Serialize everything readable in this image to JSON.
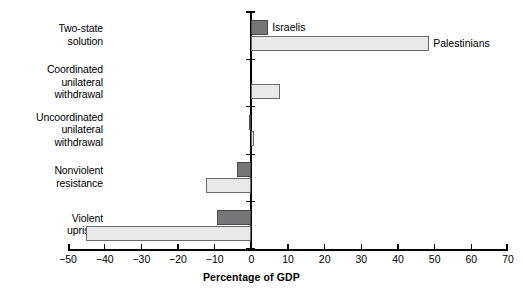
{
  "chart_data": {
    "type": "bar",
    "orientation": "horizontal",
    "title": "",
    "subtitle": "",
    "xlabel": "Percentage of GDP",
    "ylabel": "",
    "xlim": [
      -50,
      70
    ],
    "xticks": [
      -50,
      -40,
      -30,
      -20,
      -10,
      0,
      10,
      20,
      30,
      40,
      50,
      60,
      70
    ],
    "xticklabels": [
      "−50",
      "−40",
      "−30",
      "−20",
      "−10",
      "0",
      "10",
      "20",
      "30",
      "40",
      "50",
      "60",
      "70"
    ],
    "grid": false,
    "legend_position": "inline-callout",
    "categories": [
      "Two-state\nsolution",
      "Coordinated\nunilateral\nwithdrawal",
      "Uncoordinated\nunilateral\nwithdrawal",
      "Nonviolent\nresistance",
      "Violent\nuprising"
    ],
    "series": [
      {
        "name": "Israelis",
        "color": "#77777a",
        "values": [
          4.6,
          0,
          -0.6,
          -4.0,
          -9.5
        ]
      },
      {
        "name": "Palestinians",
        "color": "#e9e9e9",
        "values": [
          48.5,
          7.8,
          0.6,
          -12.5,
          -45.0
        ]
      }
    ],
    "annotations": [
      {
        "text": "Israelis",
        "series": "Israelis",
        "category_index": 0
      },
      {
        "text": "Palestinians",
        "series": "Palestinians",
        "category_index": 0
      }
    ]
  },
  "colors": {
    "israelis_fill": "#77777a",
    "israelis_stroke": "#4a4a4c",
    "palestinians_fill": "#e9e9e9",
    "palestinians_stroke": "#6b6b6b",
    "axis": "#000000",
    "background": "#ffffff"
  },
  "axis": {
    "title": "Percentage of GDP"
  }
}
